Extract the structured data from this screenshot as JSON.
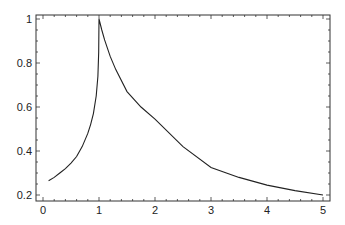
{
  "chart_data": {
    "type": "line",
    "title": "",
    "xlabel": "",
    "ylabel": "",
    "xlim": [
      -0.12,
      5.15
    ],
    "ylim": [
      0.18,
      1.02
    ],
    "grid": false,
    "legend": null,
    "x_ticks": [
      0,
      1,
      2,
      3,
      4,
      5
    ],
    "x_tick_labels": [
      "0",
      "1",
      "2",
      "3",
      "4",
      "5"
    ],
    "y_ticks": [
      0.2,
      0.4,
      0.6,
      0.8,
      1
    ],
    "y_tick_labels": [
      "0.2",
      "0.4",
      "0.6",
      "0.8",
      "1"
    ],
    "series": [
      {
        "name": "curve",
        "color": "#222222",
        "x": [
          0.1,
          0.2,
          0.3,
          0.4,
          0.5,
          0.6,
          0.7,
          0.8,
          0.85,
          0.9,
          0.95,
          0.98,
          0.995,
          1.0,
          1.05,
          1.1,
          1.2,
          1.3,
          1.5,
          1.75,
          2.0,
          2.5,
          3.0,
          3.5,
          4.0,
          4.5,
          5.0
        ],
        "y": [
          0.265,
          0.28,
          0.3,
          0.32,
          0.345,
          0.375,
          0.42,
          0.48,
          0.52,
          0.57,
          0.65,
          0.74,
          0.85,
          1.0,
          0.95,
          0.905,
          0.83,
          0.77,
          0.67,
          0.6,
          0.545,
          0.42,
          0.325,
          0.28,
          0.245,
          0.22,
          0.2
        ]
      }
    ]
  }
}
